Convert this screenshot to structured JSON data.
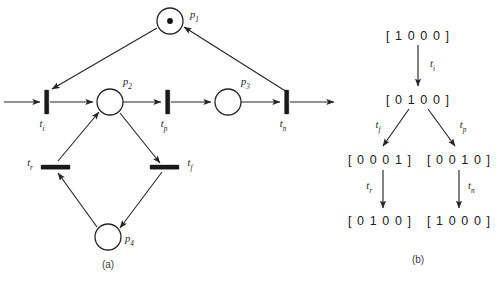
{
  "figure": {
    "panel_a_caption": "(a)",
    "panel_b_caption": "(b)",
    "ink_color": "#1a1a1a",
    "background_color": "#ffffff"
  },
  "panel_a": {
    "caption": "(a)",
    "places": [
      {
        "id": "p1",
        "name": "p",
        "sub": "1",
        "label": "p1",
        "tokens": 1,
        "cx": 170,
        "cy": 21,
        "r": 13
      },
      {
        "id": "p2",
        "name": "p",
        "sub": "2",
        "label": "p2",
        "tokens": 0,
        "cx": 110,
        "cy": 102,
        "r": 13
      },
      {
        "id": "p3",
        "name": "p",
        "sub": "3",
        "label": "p3",
        "tokens": 0,
        "cx": 228,
        "cy": 102,
        "r": 13
      },
      {
        "id": "p4",
        "name": "p",
        "sub": "4",
        "label": "p4",
        "tokens": 0,
        "cx": 108,
        "cy": 237,
        "r": 13
      }
    ],
    "transitions": [
      {
        "id": "ti",
        "name": "t",
        "sub": "i",
        "label": "ti",
        "orientation": "vertical",
        "x": 47,
        "y": 102
      },
      {
        "id": "tp",
        "name": "t",
        "sub": "p",
        "label": "tp",
        "orientation": "vertical",
        "x": 168,
        "y": 102
      },
      {
        "id": "tn",
        "name": "t",
        "sub": "n",
        "label": "tn",
        "orientation": "vertical",
        "x": 287,
        "y": 102
      },
      {
        "id": "tr",
        "name": "t",
        "sub": "r",
        "label": "tr",
        "orientation": "horizontal",
        "x": 55,
        "y": 167
      },
      {
        "id": "tf",
        "name": "t",
        "sub": "f",
        "label": "tf",
        "orientation": "horizontal",
        "x": 165,
        "y": 167
      }
    ],
    "arcs": [
      {
        "from": "source",
        "to": "ti"
      },
      {
        "from": "ti",
        "to": "p2"
      },
      {
        "from": "p2",
        "to": "tp"
      },
      {
        "from": "tp",
        "to": "p3"
      },
      {
        "from": "p3",
        "to": "tn"
      },
      {
        "from": "tn",
        "to": "sink"
      },
      {
        "from": "p1",
        "to": "ti"
      },
      {
        "from": "tn",
        "to": "p1"
      },
      {
        "from": "p2",
        "to": "tf"
      },
      {
        "from": "tf",
        "to": "p4"
      },
      {
        "from": "p4",
        "to": "tr"
      },
      {
        "from": "tr",
        "to": "p2"
      }
    ]
  },
  "panel_b": {
    "caption": "(b)",
    "nodes": [
      {
        "id": "n0",
        "marking": "[ 1 0 0 0 ]",
        "x": 418,
        "y": 36
      },
      {
        "id": "n1",
        "marking": "[ 0 1 0 0 ]",
        "x": 418,
        "y": 100
      },
      {
        "id": "n2",
        "marking": "[ 0 0 0 1 ]",
        "x": 380,
        "y": 160
      },
      {
        "id": "n3",
        "marking": "[ 0 0 1 0 ]",
        "x": 458,
        "y": 160
      },
      {
        "id": "n4",
        "marking": "[ 0 1 0 0 ]",
        "x": 380,
        "y": 221
      },
      {
        "id": "n5",
        "marking": "[ 1 0 0 0 ]",
        "x": 458,
        "y": 221
      }
    ],
    "edges": [
      {
        "from": "n0",
        "to": "n1",
        "name": "t",
        "sub": "i",
        "label": "ti"
      },
      {
        "from": "n1",
        "to": "n2",
        "name": "t",
        "sub": "f",
        "label": "tf"
      },
      {
        "from": "n1",
        "to": "n3",
        "name": "t",
        "sub": "p",
        "label": "tp"
      },
      {
        "from": "n2",
        "to": "n4",
        "name": "t",
        "sub": "r",
        "label": "tr"
      },
      {
        "from": "n3",
        "to": "n5",
        "name": "t",
        "sub": "n",
        "label": "tn"
      }
    ]
  }
}
